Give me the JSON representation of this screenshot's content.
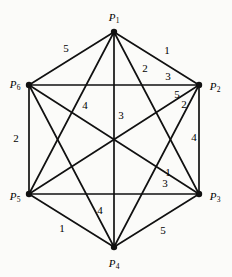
{
  "figure": {
    "background_color": "#fbfbf9",
    "stroke_color": "#111111",
    "width": 232,
    "height": 277
  },
  "vertices": [
    {
      "id": "P1",
      "name": "P",
      "sub": "1",
      "x": 114,
      "y": 32,
      "label_x": 114,
      "label_y": 17
    },
    {
      "id": "P2",
      "name": "P",
      "sub": "2",
      "x": 199,
      "y": 85,
      "label_x": 215,
      "label_y": 86
    },
    {
      "id": "P3",
      "name": "P",
      "sub": "3",
      "x": 199,
      "y": 194,
      "label_x": 215,
      "label_y": 196
    },
    {
      "id": "P4",
      "name": "P",
      "sub": "4",
      "x": 114,
      "y": 247,
      "label_x": 114,
      "label_y": 263
    },
    {
      "id": "P5",
      "name": "P",
      "sub": "5",
      "x": 29,
      "y": 194,
      "label_x": 15,
      "label_y": 196
    },
    {
      "id": "P6",
      "name": "P",
      "sub": "6",
      "x": 29,
      "y": 85,
      "label_x": 15,
      "label_y": 84
    }
  ],
  "edges": [
    {
      "from": "P1",
      "to": "P2",
      "weight": "1",
      "label_x": 167,
      "label_y": 50
    },
    {
      "from": "P1",
      "to": "P3",
      "weight": "3",
      "label_x": 168,
      "label_y": 76
    },
    {
      "from": "P1",
      "to": "P4",
      "weight": "3",
      "label_x": 121,
      "label_y": 115
    },
    {
      "from": "P1",
      "to": "P5",
      "weight": "4",
      "label_x": 85,
      "label_y": 105
    },
    {
      "from": "P1",
      "to": "P6",
      "weight": "5",
      "label_x": 66,
      "label_y": 48
    },
    {
      "from": "P2",
      "to": "P3",
      "weight": "4",
      "label_x": 194,
      "label_y": 137
    },
    {
      "from": "P2",
      "to": "P4",
      "weight": "2",
      "label_x": 184,
      "label_y": 104
    },
    {
      "from": "P2",
      "to": "P5",
      "weight": "5",
      "label_x": 177,
      "label_y": 94
    },
    {
      "from": "P2",
      "to": "P6",
      "weight": "2",
      "label_x": 145,
      "label_y": 68
    },
    {
      "from": "P3",
      "to": "P4",
      "weight": "5",
      "label_x": 163,
      "label_y": 230
    },
    {
      "from": "P3",
      "to": "P5",
      "weight": "3",
      "label_x": 165,
      "label_y": 183
    },
    {
      "from": "P3",
      "to": "P6",
      "weight": "1",
      "label_x": 168,
      "label_y": 172
    },
    {
      "from": "P4",
      "to": "P5",
      "weight": "1",
      "label_x": 62,
      "label_y": 228
    },
    {
      "from": "P4",
      "to": "P6",
      "weight": "4",
      "label_x": 100,
      "label_y": 210
    },
    {
      "from": "P5",
      "to": "P6",
      "weight": "2",
      "label_x": 16,
      "label_y": 138
    }
  ],
  "chart_data": {
    "type": "diagram",
    "graph_type": "complete-graph-K6",
    "node_labels": [
      "P1",
      "P2",
      "P3",
      "P4",
      "P5",
      "P6"
    ],
    "edge_list": [
      [
        "P1",
        "P2",
        1
      ],
      [
        "P1",
        "P3",
        3
      ],
      [
        "P1",
        "P4",
        3
      ],
      [
        "P1",
        "P5",
        4
      ],
      [
        "P1",
        "P6",
        5
      ],
      [
        "P2",
        "P3",
        4
      ],
      [
        "P2",
        "P4",
        2
      ],
      [
        "P2",
        "P5",
        5
      ],
      [
        "P2",
        "P6",
        2
      ],
      [
        "P3",
        "P4",
        5
      ],
      [
        "P3",
        "P5",
        3
      ],
      [
        "P3",
        "P6",
        1
      ],
      [
        "P4",
        "P5",
        1
      ],
      [
        "P4",
        "P6",
        4
      ],
      [
        "P5",
        "P6",
        2
      ]
    ]
  }
}
